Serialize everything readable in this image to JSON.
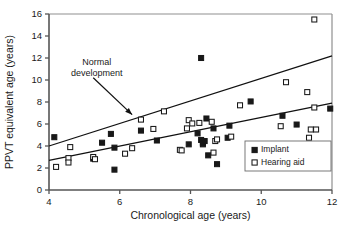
{
  "chart_data": {
    "type": "scatter",
    "title": "",
    "xlabel": "Chronological age (years)",
    "ylabel": "PPVT equivalent age (years)",
    "xlim": [
      4,
      12
    ],
    "ylim": [
      0,
      16
    ],
    "xticks": [
      4,
      6,
      8,
      10,
      12
    ],
    "yticks": [
      0,
      2,
      4,
      6,
      8,
      10,
      12,
      14,
      16
    ],
    "grid": false,
    "legend_position": "bottom-right",
    "legend": [
      {
        "name": "Implant",
        "marker": "filled-square",
        "color": "#1a1a1a"
      },
      {
        "name": "Hearing aid",
        "marker": "open-square",
        "color": "#1a1a1a"
      }
    ],
    "annotations": [
      {
        "text_line1": "Normal",
        "text_line2": "development",
        "text_x": 5.35,
        "text_y": 11.4,
        "arrow_from_x": 5.25,
        "arrow_from_y": 10.2,
        "arrow_to_x": 6.35,
        "arrow_to_y": 6.85
      }
    ],
    "lines": [
      {
        "name": "Normal development",
        "x": [
          4,
          12
        ],
        "y": [
          4.0,
          12.2
        ]
      },
      {
        "name": "Regression",
        "x": [
          4,
          12
        ],
        "y": [
          2.7,
          7.9
        ]
      }
    ],
    "series": [
      {
        "name": "Implant",
        "marker": "filled-square",
        "points": [
          [
            4.15,
            4.8
          ],
          [
            5.25,
            2.85
          ],
          [
            5.5,
            4.3
          ],
          [
            5.75,
            5.1
          ],
          [
            5.85,
            3.85
          ],
          [
            5.85,
            1.85
          ],
          [
            6.6,
            5.4
          ],
          [
            7.05,
            4.5
          ],
          [
            7.95,
            4.15
          ],
          [
            8.2,
            5.15
          ],
          [
            8.3,
            12.0
          ],
          [
            8.3,
            4.55
          ],
          [
            8.35,
            4.3
          ],
          [
            8.35,
            4.15
          ],
          [
            8.4,
            4.45
          ],
          [
            8.45,
            6.5
          ],
          [
            8.5,
            3.15
          ],
          [
            8.65,
            5.6
          ],
          [
            8.75,
            2.35
          ],
          [
            9.05,
            4.75
          ],
          [
            9.1,
            5.85
          ],
          [
            9.7,
            8.05
          ],
          [
            10.6,
            6.75
          ],
          [
            11.0,
            5.95
          ],
          [
            11.95,
            7.4
          ]
        ]
      },
      {
        "name": "Hearing aid",
        "marker": "open-square",
        "points": [
          [
            4.2,
            2.1
          ],
          [
            4.55,
            2.9
          ],
          [
            4.55,
            2.5
          ],
          [
            4.6,
            3.9
          ],
          [
            5.25,
            3.0
          ],
          [
            5.3,
            2.8
          ],
          [
            6.15,
            3.3
          ],
          [
            6.35,
            3.8
          ],
          [
            6.6,
            6.4
          ],
          [
            6.95,
            5.55
          ],
          [
            7.25,
            7.15
          ],
          [
            7.7,
            3.65
          ],
          [
            7.75,
            3.6
          ],
          [
            7.9,
            5.6
          ],
          [
            7.95,
            6.35
          ],
          [
            8.05,
            6.05
          ],
          [
            8.25,
            6.1
          ],
          [
            8.6,
            6.2
          ],
          [
            8.65,
            3.4
          ],
          [
            8.7,
            4.45
          ],
          [
            8.75,
            4.6
          ],
          [
            9.15,
            4.85
          ],
          [
            9.4,
            7.7
          ],
          [
            10.55,
            5.8
          ],
          [
            10.7,
            9.8
          ],
          [
            11.3,
            8.9
          ],
          [
            11.35,
            4.75
          ],
          [
            11.4,
            5.5
          ],
          [
            11.55,
            5.5
          ],
          [
            11.5,
            7.5
          ],
          [
            11.5,
            15.5
          ]
        ]
      }
    ]
  }
}
